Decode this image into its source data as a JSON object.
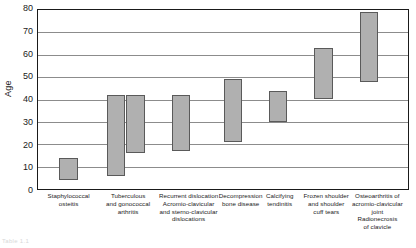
{
  "chart_data": {
    "type": "bar",
    "subtype": "floating-range-bar",
    "title": "",
    "xlabel": "",
    "ylabel": "Age",
    "ylim": [
      0,
      80
    ],
    "ytick_step": 10,
    "yticks": [
      0,
      10,
      20,
      30,
      40,
      50,
      60,
      70,
      80
    ],
    "ytick_labels": [
      "0",
      "10",
      "20",
      "30",
      "40",
      "50",
      "60",
      "70",
      "80"
    ],
    "grid": "horizontal",
    "legend": "none",
    "bar_fill_color": "#b0b0b0",
    "bar_border_color": "#5a5a5a",
    "axis_color": "#1a1a1a",
    "gridline_color": "#8c8c8c",
    "categories": [
      "Staphylococcal osteitis",
      "Tuberculous and gonococcal arthritis",
      "Recurrent dislocation Acromio-clavicular and sterno-clavicular dislocations",
      "Decompression bone disease",
      "Calcifying tendinitis",
      "Frozen shoulder and shoulder cuff tears",
      "Osteoarthritis of acromio-clavicular joint Radionecrosis of clavicle"
    ],
    "bars": [
      {
        "category": "Staphylococcal osteitis",
        "low": 4,
        "high": 14,
        "center_pct": 8.3,
        "width_pct": 5.0
      },
      {
        "category": "Tuberculous and gonococcal arthritis",
        "low": 6,
        "high": 42,
        "center_pct": 21.1,
        "width_pct": 5.0
      },
      {
        "category": "Tuberculous and gonococcal arthritis",
        "low": 16,
        "high": 42,
        "center_pct": 26.4,
        "width_pct": 5.0
      },
      {
        "category": "Recurrent dislocation Acromio-clavicular and sterno-clavicular dislocations",
        "low": 17,
        "high": 42,
        "center_pct": 38.7,
        "width_pct": 5.0
      },
      {
        "category": "Decompression bone disease",
        "low": 21,
        "high": 49,
        "center_pct": 52.7,
        "width_pct": 5.0
      },
      {
        "category": "Calcifying tendinitis",
        "low": 30,
        "high": 44,
        "center_pct": 64.8,
        "width_pct": 5.0
      },
      {
        "category": "Frozen shoulder and shoulder cuff tears",
        "low": 40,
        "high": 63,
        "center_pct": 77.2,
        "width_pct": 5.0
      },
      {
        "category": "Osteoarthritis of acromio-clavicular joint Radionecrosis of clavicle",
        "low": 48,
        "high": 79,
        "center_pct": 89.5,
        "width_pct": 5.0
      }
    ],
    "category_label_lines": [
      [
        "Staphylococcal",
        "osteitis"
      ],
      [
        "Tuberculous",
        "and gonococcal",
        "arthritis"
      ],
      [
        "Recurrent dislocation",
        "Acromio-clavicular",
        "and sterno-clavicular",
        "dislocations"
      ],
      [
        "Decompression",
        "bone disease"
      ],
      [
        "Calcifying",
        "tendinitis"
      ],
      [
        "Frozen shoulder",
        "and shoulder",
        "cuff tears"
      ],
      [
        "Osteoarthritis of",
        "acromio-clavicular",
        "joint",
        "Radionecrosis",
        "of clavicle"
      ]
    ],
    "category_label_positions": [
      {
        "left_pct": 0.5,
        "width_pct": 16.0
      },
      {
        "left_pct": 16.5,
        "width_pct": 16.0
      },
      {
        "left_pct": 31.0,
        "width_pct": 19.5
      },
      {
        "left_pct": 46.5,
        "width_pct": 16.5
      },
      {
        "left_pct": 58.5,
        "width_pct": 13.5
      },
      {
        "left_pct": 69.5,
        "width_pct": 16.5
      },
      {
        "left_pct": 83.0,
        "width_pct": 17.0
      }
    ]
  },
  "caption": {
    "bottom_text": "Table 1.1"
  }
}
